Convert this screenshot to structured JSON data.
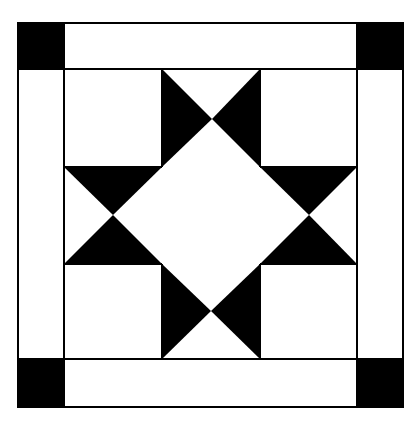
{
  "diagram": {
    "type": "quilt-block",
    "pattern": "ohio-star-with-sashing-and-cornerstones",
    "canvas": {
      "width": 419,
      "height": 424
    },
    "colors": {
      "background": "#ffffff",
      "fill_dark": "#000000",
      "line": "#000000"
    },
    "outer_frame": {
      "x": 18,
      "y": 23,
      "w": 385,
      "h": 384
    },
    "inner_square": {
      "x": 64,
      "y": 69,
      "w": 293,
      "h": 290
    },
    "cornerstones": [
      {
        "name": "top-left",
        "x": 18,
        "y": 23,
        "w": 46,
        "h": 46
      },
      {
        "name": "top-right",
        "x": 357,
        "y": 23,
        "w": 46,
        "h": 46
      },
      {
        "name": "bottom-left",
        "x": 18,
        "y": 359,
        "w": 46,
        "h": 48
      },
      {
        "name": "bottom-right",
        "x": 357,
        "y": 359,
        "w": 46,
        "h": 48
      }
    ],
    "grid_lines": {
      "vertical": [
        162,
        260
      ],
      "horizontal": [
        167,
        264
      ]
    },
    "star_triangles": [
      {
        "name": "top-left-point",
        "points": "162,69 162,167 212,119"
      },
      {
        "name": "top-right-point",
        "points": "260,69 260,167 212,119"
      },
      {
        "name": "left-top-point",
        "points": "64,167 162,167 113,215"
      },
      {
        "name": "left-bottom-point",
        "points": "64,264 162,264 113,215"
      },
      {
        "name": "right-top-point",
        "points": "260,167 357,167 309,215"
      },
      {
        "name": "right-bottom-point",
        "points": "260,264 357,264 309,215"
      },
      {
        "name": "bottom-left-point",
        "points": "162,264 162,359 211,311"
      },
      {
        "name": "bottom-right-point",
        "points": "260,264 260,359 211,311"
      }
    ]
  }
}
